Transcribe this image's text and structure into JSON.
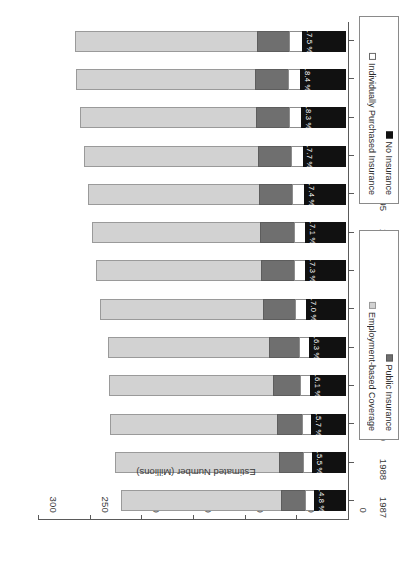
{
  "chart_data": {
    "type": "bar",
    "subtype": "stacked-horizontal",
    "title": "",
    "xlabel": "",
    "ylabel": "Estimated Number (Millions)",
    "axis_title": "Estimated Number (Millions)",
    "ylim": [
      0,
      300
    ],
    "value_ticks": [
      "300",
      "250",
      "200",
      "150",
      "100",
      "50",
      "0"
    ],
    "value_tick_values": [
      300,
      250,
      200,
      150,
      100,
      50,
      0
    ],
    "axis_reversed": true,
    "grid": false,
    "legend_position": "right",
    "categories": [
      "1987",
      "1988",
      "1989",
      "1990",
      "1991",
      "1992",
      "1993",
      "1994",
      "1995",
      "1996",
      "1997",
      "1998",
      "1999"
    ],
    "series": [
      {
        "name": "No Insurance",
        "color": "#111111",
        "values": [
          31.0,
          32.7,
          33.4,
          34.7,
          35.4,
          38.6,
          39.7,
          39.7,
          40.6,
          41.7,
          43.4,
          44.3,
          42.6
        ]
      },
      {
        "name": "Individually Purchased Insurance",
        "color": "#ffffff",
        "values": [
          9.5,
          9.9,
          10.2,
          10.6,
          11.0,
          11.3,
          11.7,
          12.0,
          12.2,
          12.5,
          12.8,
          13.0,
          13.2
        ]
      },
      {
        "name": "Public Insurance",
        "color": "#6f6f6f",
        "values": [
          24.0,
          24.5,
          25.3,
          27.0,
          29.7,
          31.9,
          33.2,
          33.9,
          33.6,
          33.1,
          32.6,
          32.3,
          32.0
        ]
      },
      {
        "name": "Employment-based Coverage",
        "color": "#d2d2d2",
        "values": [
          156.0,
          159.0,
          162.0,
          160.0,
          157.0,
          159.0,
          160.0,
          163.0,
          166.0,
          169.0,
          172.0,
          175.0,
          177.0
        ]
      }
    ],
    "bar_totals": [
      220.5,
      226.1,
      230.9,
      232.3,
      233.1,
      240.8,
      244.6,
      248.6,
      252.4,
      256.3,
      260.8,
      264.6,
      264.8
    ],
    "data_labels": [
      {
        "category": "1987",
        "text": "14.8 %",
        "value": 14.8
      },
      {
        "category": "1988",
        "text": "15.5 %",
        "value": 15.5
      },
      {
        "category": "1989",
        "text": "15.7 %",
        "value": 15.7
      },
      {
        "category": "1990",
        "text": "16.1 %",
        "value": 16.1
      },
      {
        "category": "1991",
        "text": "16.3 %",
        "value": 16.3
      },
      {
        "category": "1992",
        "text": "17.0 %",
        "value": 17.0
      },
      {
        "category": "1993",
        "text": "17.3 %",
        "value": 17.3
      },
      {
        "category": "1994",
        "text": "17.1 %",
        "value": 17.1
      },
      {
        "category": "1995",
        "text": "17.4 %",
        "value": 17.4
      },
      {
        "category": "1996",
        "text": "17.7 %",
        "value": 17.7
      },
      {
        "category": "1997",
        "text": "18.3 %",
        "value": 18.3
      },
      {
        "category": "1998",
        "text": "18.4 %",
        "value": 18.4
      },
      {
        "category": "1999",
        "text": "17.5 %",
        "value": 17.5
      }
    ],
    "legends": [
      {
        "id": "legend-top",
        "entries": [
          {
            "label": "Public Insurance",
            "color": "#6f6f6f"
          },
          {
            "label": "Employment-based Coverage",
            "color": "#d2d2d2"
          }
        ]
      },
      {
        "id": "legend-bottom",
        "entries": [
          {
            "label": "No Insurance",
            "color": "#111111"
          },
          {
            "label": "Individually Purchased Insurance",
            "color": "#ffffff"
          }
        ]
      }
    ]
  }
}
